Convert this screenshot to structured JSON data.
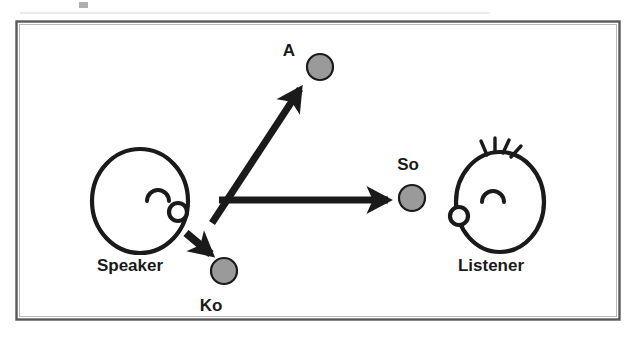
{
  "figure": {
    "background_color": "#ffffff",
    "frame": {
      "name": "figure-border",
      "color": "#595959",
      "x": 16,
      "y": 21,
      "width": 604,
      "height": 299
    },
    "ink_color": "#1a1a1a",
    "sphere_fill": "#9a9a9a",
    "sphere_stroke": "#1a1a1a"
  },
  "actors": [
    {
      "id": "speaker",
      "label": "Speaker",
      "label_x": 130,
      "label_y": 271,
      "head": {
        "cx": 140,
        "cy": 201,
        "rx": 48,
        "ry": 52
      },
      "eye": {
        "cx": 158,
        "cy": 196,
        "r": 11
      },
      "mouth": {
        "cx": 178,
        "cy": 212,
        "r": 9
      },
      "has_hair": false
    },
    {
      "id": "listener",
      "label": "Listener",
      "label_x": 491,
      "label_y": 271,
      "head": {
        "cx": 500,
        "cy": 201,
        "rx": 44,
        "ry": 50
      },
      "eye": {
        "cx": 492,
        "cy": 198,
        "r": 11
      },
      "mouth": {
        "cx": 459,
        "cy": 215,
        "r": 9
      },
      "has_hair": true,
      "hair_strands": 4
    }
  ],
  "spheres": [
    {
      "id": "a",
      "label": "A",
      "cx": 320,
      "cy": 67,
      "r": 13,
      "label_x": 289,
      "label_y": 55
    },
    {
      "id": "so",
      "label": "So",
      "cx": 412,
      "cy": 198,
      "r": 13,
      "label_x": 389,
      "label_y": 170
    },
    {
      "id": "ko",
      "label": "Ko",
      "cx": 224,
      "cy": 271,
      "r": 13,
      "label_x": 200,
      "label_y": 311
    }
  ],
  "arrows": [
    {
      "id": "arrow-to-a",
      "from_label": "Speaker",
      "to_label": "A",
      "x1": 212,
      "y1": 223,
      "x2": 302,
      "y2": 87,
      "thickness": 7,
      "head_size": 17
    },
    {
      "id": "arrow-to-so",
      "from_label": "Speaker",
      "to_label": "So",
      "x1": 219,
      "y1": 200,
      "x2": 392,
      "y2": 200,
      "thickness": 7,
      "head_size": 17
    },
    {
      "id": "arrow-to-ko",
      "from_label": "Speaker",
      "to_label": "Ko",
      "x1": 186,
      "y1": 234,
      "x2": 214,
      "y2": 258,
      "thickness": 8,
      "head_size": 16
    }
  ]
}
